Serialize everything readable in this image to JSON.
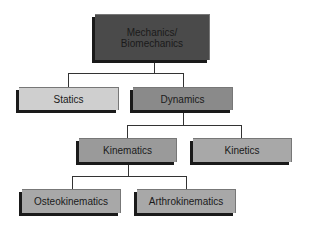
{
  "diagram": {
    "nodes": {
      "root": {
        "label": "Mechanics/\nBiomechanics",
        "line1": "Mechanics/",
        "line2": "Biomechanics",
        "fill": "#4a4a4a"
      },
      "statics": {
        "label": "Statics",
        "fill": "#cfcfcf"
      },
      "dynamics": {
        "label": "Dynamics",
        "fill": "#8a8a8a"
      },
      "kinematics": {
        "label": "Kinematics",
        "fill": "#9a9a9a"
      },
      "kinetics": {
        "label": "Kinetics",
        "fill": "#a8a8a8"
      },
      "osteokinematics": {
        "label": "Osteokinematics",
        "fill": "#a8a8a8"
      },
      "arthrokinematics": {
        "label": "Arthrokinematics",
        "fill": "#a8a8a8"
      }
    },
    "edges": [
      [
        "Mechanics/Biomechanics",
        "Statics"
      ],
      [
        "Mechanics/Biomechanics",
        "Dynamics"
      ],
      [
        "Dynamics",
        "Kinematics"
      ],
      [
        "Dynamics",
        "Kinetics"
      ],
      [
        "Kinematics",
        "Osteokinematics"
      ],
      [
        "Kinematics",
        "Arthrokinematics"
      ]
    ]
  }
}
